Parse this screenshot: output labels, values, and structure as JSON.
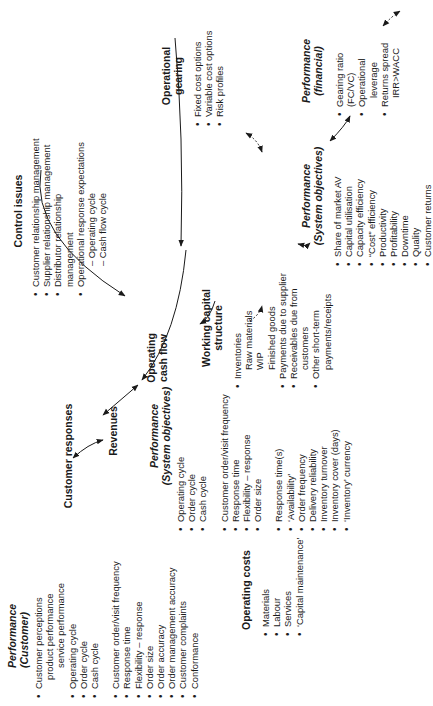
{
  "diagram": {
    "orientation": "rotated 90 degrees counter-clockwise",
    "center": {
      "title": "Operating cash flow"
    },
    "performance_customer": {
      "title_line1": "Performance",
      "title_line2": "(Customer)",
      "group1": [
        "Customer perceptions",
        "product performance",
        "service performance",
        "Operating cycle",
        "Order cycle",
        "Cash cycle"
      ],
      "group2": [
        "Customer order/visit frequency",
        "Response time",
        "Flexibility – response",
        "Order size",
        "Order accuracy",
        "Order management accuracy",
        "Customer complaints",
        "Conformance"
      ]
    },
    "customer_responses": {
      "title": "Customer responses"
    },
    "revenues": {
      "title": "Revenues"
    },
    "performance_system_left": {
      "title_line1": "Performance",
      "title_line2": "(System objectives)",
      "group1": [
        "Operating cycle",
        "Order cycle",
        "Cash cycle"
      ],
      "group2": [
        "Customer order/visit frequency",
        "Response time",
        "Flexibility – response",
        "Order size"
      ],
      "group3": [
        "Response time(s)",
        "‘Availability’",
        "Order frequency",
        "Delivery reliability",
        "Inventory turnover",
        "Inventory cover (days)",
        "‘Inventory’ currency"
      ]
    },
    "operating_costs": {
      "title": "Operating costs",
      "items": [
        "Materials",
        "Labour",
        "Services",
        "‘Capital maintenance’"
      ]
    },
    "control_issues": {
      "title": "Control issues",
      "items": [
        "Customer relationship management",
        "Supplier relationship management",
        "Distributor relationship",
        "management",
        "Operational response expectations",
        "– Operating cycle",
        "– Cash flow cycle"
      ]
    },
    "working_capital": {
      "title_line1": "Working capital",
      "title_line2": "structure",
      "items": [
        "Inventories",
        "Raw materials",
        "WIP",
        "Finished goods",
        "Payments due to supplier",
        "Receivables due from",
        "customers",
        "Other short-term",
        "payments/receipts"
      ]
    },
    "operational_gearing": {
      "title_line1": "Operational",
      "title_line2": "gearing",
      "items": [
        "Fixed cost options",
        "Variable cost options",
        "Risk profiles"
      ]
    },
    "performance_system_right": {
      "title_line1": "Performance",
      "title_line2": "(System objectives)",
      "items": [
        "Share of market AV",
        "Capital utilisation",
        "Capacity efficiency",
        "“Cost” efficiency",
        "Productivity",
        "Profitability",
        "Downtime",
        "Quality",
        "Customer returns"
      ]
    },
    "performance_financial": {
      "title_line1": "Performance",
      "title_line2": "(financial)",
      "items": [
        "Gearing ratio",
        "(FC/VC)",
        "Operational",
        "leverage",
        "Returns spread",
        "IRR>WACC"
      ]
    }
  }
}
